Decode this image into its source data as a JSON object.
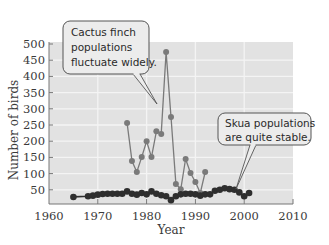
{
  "chart_data": {
    "type": "line",
    "title": "",
    "xlabel": "Year",
    "ylabel": "Number of birds",
    "xlim": [
      1960,
      2010
    ],
    "ylim": [
      0,
      500
    ],
    "x_ticks": [
      1960,
      1970,
      1980,
      1990,
      2000,
      2010
    ],
    "y_ticks": [
      50,
      100,
      150,
      200,
      250,
      300,
      350,
      400,
      450,
      500
    ],
    "grid": true,
    "legend": null,
    "series": [
      {
        "name": "Cactus finch",
        "color": "#7a7a7a",
        "points": [
          [
            1976,
            256
          ],
          [
            1977,
            139
          ],
          [
            1978,
            105
          ],
          [
            1979,
            151
          ],
          [
            1980,
            200
          ],
          [
            1981,
            151
          ],
          [
            1982,
            231
          ],
          [
            1983,
            222
          ],
          [
            1984,
            475
          ],
          [
            1985,
            275
          ],
          [
            1986,
            68
          ],
          [
            1987,
            52
          ],
          [
            1988,
            145
          ],
          [
            1989,
            102
          ],
          [
            1990,
            74
          ],
          [
            1991,
            40
          ],
          [
            1992,
            105
          ]
        ]
      },
      {
        "name": "Skua",
        "color": "#2e2e2e",
        "points": [
          [
            1965,
            28
          ],
          [
            1968,
            30
          ],
          [
            1969,
            32
          ],
          [
            1970,
            35
          ],
          [
            1971,
            37
          ],
          [
            1972,
            38
          ],
          [
            1973,
            38
          ],
          [
            1974,
            38
          ],
          [
            1975,
            38
          ],
          [
            1976,
            45
          ],
          [
            1977,
            38
          ],
          [
            1978,
            35
          ],
          [
            1979,
            40
          ],
          [
            1980,
            36
          ],
          [
            1981,
            45
          ],
          [
            1982,
            38
          ],
          [
            1983,
            33
          ],
          [
            1984,
            30
          ],
          [
            1985,
            18
          ],
          [
            1986,
            30
          ],
          [
            1987,
            36
          ],
          [
            1988,
            38
          ],
          [
            1989,
            38
          ],
          [
            1990,
            36
          ],
          [
            1991,
            32
          ],
          [
            1992,
            36
          ],
          [
            1993,
            36
          ],
          [
            1994,
            47
          ],
          [
            1995,
            50
          ],
          [
            1996,
            55
          ],
          [
            1997,
            52
          ],
          [
            1998,
            50
          ],
          [
            1999,
            42
          ],
          [
            2000,
            30
          ],
          [
            2001,
            40
          ]
        ]
      }
    ],
    "annotations": [
      {
        "text": "Cactus finch populations fluctuate widely.",
        "target_series": "Cactus finch"
      },
      {
        "text": "Skua populations are quite stable.",
        "target_series": "Skua"
      }
    ]
  },
  "callouts": {
    "finch": [
      "Cactus finch",
      "populations",
      "fluctuate widely."
    ],
    "skua": [
      "Skua populations",
      "are quite stable."
    ]
  },
  "colors": {
    "plot_bg": "#e2e2e2",
    "grid": "#f4f4f4",
    "axis": "#777777",
    "callout_bg": "#ececec",
    "callout_border": "#555555"
  }
}
